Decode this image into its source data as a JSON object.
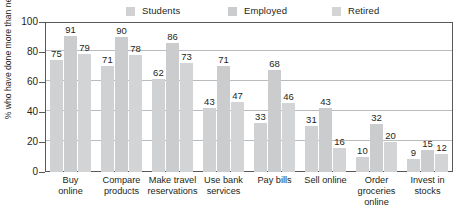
{
  "chart_data": {
    "type": "bar",
    "title": "",
    "xlabel": "",
    "ylabel": "% who have done more than never",
    "ylim": [
      0,
      100
    ],
    "ytick_step": 20,
    "yticks": [
      0,
      20,
      40,
      60,
      80,
      100
    ],
    "ytick_labels": [
      "0",
      "20",
      "40",
      "60",
      "80",
      "100"
    ],
    "grid": "horizontal",
    "legend_position": "top",
    "legend": [
      "Students",
      "Employed",
      "Retired"
    ],
    "categories": [
      "Buy online",
      "Compare products",
      "Make travel reservations",
      "Use bank services",
      "Pay bills",
      "Sell online",
      "Order groceries online",
      "Invest in stocks"
    ],
    "category_lines": [
      [
        "Buy",
        "online"
      ],
      [
        "Compare",
        "products"
      ],
      [
        "Make travel",
        "reservations"
      ],
      [
        "Use bank",
        "services"
      ],
      [
        "Pay bills"
      ],
      [
        "Sell online"
      ],
      [
        "Order",
        "groceries",
        "online"
      ],
      [
        "Invest in",
        "stocks"
      ]
    ],
    "series": [
      {
        "name": "Students",
        "values": [
          75,
          71,
          62,
          43,
          33,
          31,
          10,
          9
        ]
      },
      {
        "name": "Employed",
        "values": [
          91,
          90,
          86,
          71,
          68,
          43,
          32,
          15
        ]
      },
      {
        "name": "Retired",
        "values": [
          79,
          78,
          73,
          47,
          46,
          16,
          20,
          12
        ]
      }
    ],
    "colors": {
      "students_bar": "#d0d1d3",
      "employed_bar": "#cbcccd",
      "retired_bar": "#d3d4d6",
      "axis": "#58595b",
      "gridline": "#b9bbbd",
      "text": "#231f20"
    }
  },
  "title_sliver": {
    "text": ""
  }
}
